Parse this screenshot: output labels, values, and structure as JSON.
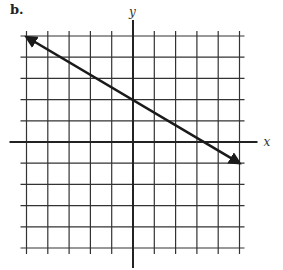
{
  "figure_label": "b.",
  "chart_data": {
    "type": "line",
    "title": "",
    "xlabel": "x",
    "ylabel": "y",
    "grid": true,
    "xlim": [
      -5,
      5
    ],
    "ylim": [
      -5,
      5
    ],
    "x_tick_labels": [],
    "y_tick_labels": [],
    "series": [
      {
        "name": "line",
        "equation": "y = -2/3 x + 2",
        "x": [
          -5,
          0,
          3,
          5
        ],
        "y": [
          5,
          2,
          0,
          -1
        ],
        "arrows": "both"
      }
    ],
    "legend": null
  },
  "colors": {
    "grid": "#333333",
    "line": "#1a1a1a",
    "background": "#ffffff"
  }
}
